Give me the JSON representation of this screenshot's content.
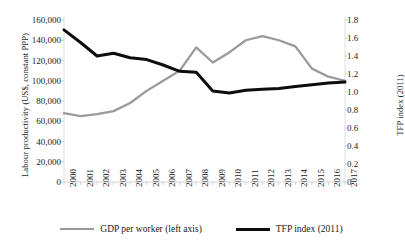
{
  "chart_data": {
    "type": "line",
    "title": "",
    "xlabel": "",
    "ylabel": "Labour productivity (US$, constant PPP)",
    "y2label": "TFP index (2011)",
    "categories": [
      "2000",
      "2001",
      "2002",
      "2003",
      "2004",
      "2005",
      "2006",
      "2007",
      "2008",
      "2009",
      "2010",
      "2011",
      "2012",
      "2013",
      "2014",
      "2015",
      "2016",
      "2017"
    ],
    "ylim": [
      0,
      160000
    ],
    "y2lim": [
      0,
      1.8
    ],
    "yticks": [
      "0",
      "20,000",
      "40,000",
      "60,000",
      "80,000",
      "100,000",
      "120,000",
      "140,000",
      "160,000"
    ],
    "ytick_values": [
      0,
      20000,
      40000,
      60000,
      80000,
      100000,
      120000,
      140000,
      160000
    ],
    "y2ticks": [
      "0",
      "0.2",
      "0.4",
      "0.6",
      "0.8",
      "1.0",
      "1.2",
      "1.4",
      "1.6",
      "1.8"
    ],
    "y2tick_values": [
      0,
      0.2,
      0.4,
      0.6,
      0.8,
      1.0,
      1.2,
      1.4,
      1.6,
      1.8
    ],
    "grid": false,
    "legend_position": "bottom",
    "series": [
      {
        "name": "GDP per worker (left axis)",
        "axis": "left",
        "color": "#9a9a9a",
        "values": [
          68000,
          65000,
          67000,
          70000,
          78000,
          90000,
          100000,
          110000,
          133000,
          118000,
          128000,
          140000,
          144000,
          140000,
          134000,
          112000,
          104000,
          100000
        ]
      },
      {
        "name": "TFP index (2011)",
        "axis": "right",
        "color": "#0d0d0d",
        "values": [
          1.69,
          1.55,
          1.4,
          1.43,
          1.38,
          1.36,
          1.3,
          1.23,
          1.22,
          1.01,
          0.99,
          1.02,
          1.03,
          1.04,
          1.06,
          1.08,
          1.1,
          1.11
        ]
      }
    ],
    "legend": [
      {
        "label": "GDP per worker (left axis)",
        "color": "#9a9a9a",
        "width": 2.6
      },
      {
        "label": "TFP index (2011)",
        "color": "#0d0d0d",
        "width": 3.4
      }
    ]
  },
  "axes": {
    "left_title": "Labour productivity (US$, constant PPP)",
    "right_title": "TFP index (2011)"
  }
}
